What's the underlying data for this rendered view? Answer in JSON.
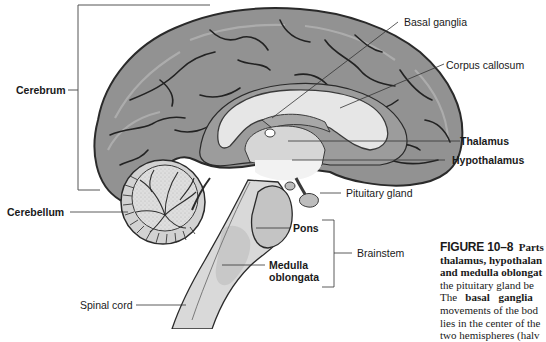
{
  "diagram": {
    "labels": {
      "cerebrum": "Cerebrum",
      "cerebellum": "Cerebellum",
      "spinal_cord": "Spinal cord",
      "basal_ganglia": "Basal ganglia",
      "corpus_callosum": "Corpus callosum",
      "thalamus": "Thalamus",
      "hypothalamus": "Hypothalamus",
      "pituitary_gland": "Pituitary gland",
      "pons": "Pons",
      "medulla_line1": "Medulla",
      "medulla_line2": "oblongata",
      "brainstem": "Brainstem"
    },
    "colors": {
      "cortex": "#8f8f8f",
      "cortex_outline": "#2a2a2a",
      "white_matter": "#e4e4e4",
      "light_region": "#d3d3d3",
      "brainstem": "#c8c8c8",
      "leader_line": "#333333"
    }
  },
  "caption": {
    "figure_number": "FIGURE 10–8",
    "line1_rest": "Parts",
    "line2": "thalamus, hypothalan",
    "line3": "and medulla oblongat",
    "line4": "the pituitary gland be",
    "line5_pre": "The",
    "line5_bold": "basal ganglia",
    "line6": "movements of the bod",
    "line7": "lies in the center of the",
    "line8": "two hemispheres (halv"
  }
}
